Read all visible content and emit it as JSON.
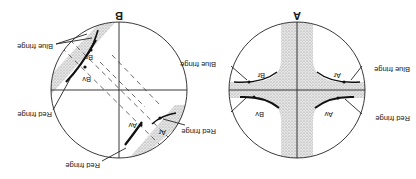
{
  "figure": {
    "orientation": "rotated-180",
    "panels": [
      {
        "id": "A",
        "title": "A",
        "labels": {
          "blue_fringe_right": "Blue fringe",
          "red_fringe_right": "Red fringe",
          "blue_fringe_left": "Blue fringe",
          "red_fringe_left": "Red fringe",
          "ar": "Ar",
          "av": "Av",
          "br": "Br",
          "bv": "Bv"
        }
      },
      {
        "id": "B",
        "title": "B",
        "labels": {
          "blue_fringe_right": "Blue fringe",
          "red_fringe_right": "Red fringe",
          "blue_fringe_left": "Blue fringe",
          "red_fringe_left": "Red fringe",
          "red_fringe_bottom": "Red fringe",
          "ar": "Ar",
          "av": "Av",
          "br": "Br",
          "bv": "Bv"
        }
      }
    ],
    "colors": {
      "ink": "#1a1a1a",
      "stipple": "#c8c8c8",
      "background": "#ffffff"
    }
  }
}
